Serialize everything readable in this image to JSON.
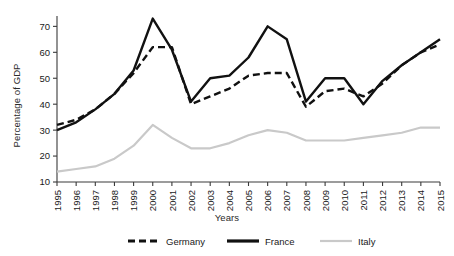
{
  "chart_data": {
    "type": "line",
    "title": "",
    "xlabel": "Years",
    "ylabel": "Percentage of GDP",
    "x": [
      1995,
      1996,
      1997,
      1998,
      1999,
      2000,
      2001,
      2002,
      2003,
      2004,
      2005,
      2006,
      2007,
      2008,
      2009,
      2010,
      2011,
      2012,
      2013,
      2014,
      2015
    ],
    "categories": [
      "1995",
      "1996",
      "1997",
      "1998",
      "1999",
      "2000",
      "2001",
      "2002",
      "2003",
      "2004",
      "2005",
      "2006",
      "2007",
      "2008",
      "2009",
      "2010",
      "2011",
      "2012",
      "2013",
      "2014",
      "2015"
    ],
    "xlim": [
      1995,
      2015
    ],
    "ylim": [
      10,
      74
    ],
    "yticks": [
      10,
      20,
      30,
      40,
      50,
      60,
      70
    ],
    "ytick_labels": [
      "10",
      "20",
      "30",
      "40",
      "50",
      "60",
      "70"
    ],
    "grid": false,
    "legend_position": "bottom",
    "series": [
      {
        "name": "Germany",
        "style": "dashed",
        "color": "#111111",
        "values": [
          32,
          34,
          38,
          44,
          52,
          62,
          62,
          40,
          43,
          46,
          51,
          52,
          52,
          39,
          45,
          46,
          43,
          48,
          55,
          60,
          63
        ]
      },
      {
        "name": "France",
        "style": "solid",
        "color": "#111111",
        "values": [
          30,
          33,
          38,
          44,
          53,
          73,
          61,
          41,
          50,
          51,
          58,
          70,
          65,
          41,
          50,
          50,
          40,
          49,
          55,
          60,
          65
        ]
      },
      {
        "name": "Italy",
        "style": "solid",
        "color": "#c9c9c9",
        "values": [
          14,
          15,
          16,
          19,
          24,
          32,
          27,
          23,
          23,
          25,
          28,
          30,
          29,
          26,
          26,
          26,
          27,
          28,
          29,
          31,
          31
        ]
      }
    ]
  },
  "legend": {
    "items": [
      {
        "label": "Germany"
      },
      {
        "label": "France"
      },
      {
        "label": "Italy"
      }
    ]
  }
}
